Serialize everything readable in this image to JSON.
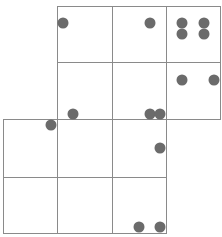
{
  "diagram": {
    "line_color": "#8a8a8a",
    "dot_color": "#6b6b6b",
    "cells": [
      {
        "row": 0,
        "col": 1,
        "x": 57,
        "y": 6,
        "w": 56,
        "h": 57
      },
      {
        "row": 0,
        "col": 2,
        "x": 112,
        "y": 6,
        "w": 55,
        "h": 57
      },
      {
        "row": 0,
        "col": 3,
        "x": 166,
        "y": 6,
        "w": 55,
        "h": 57
      },
      {
        "row": 1,
        "col": 1,
        "x": 57,
        "y": 62,
        "w": 56,
        "h": 58
      },
      {
        "row": 1,
        "col": 2,
        "x": 112,
        "y": 62,
        "w": 55,
        "h": 58
      },
      {
        "row": 1,
        "col": 3,
        "x": 166,
        "y": 62,
        "w": 55,
        "h": 58
      },
      {
        "row": 2,
        "col": 0,
        "x": 3,
        "y": 119,
        "w": 55,
        "h": 59
      },
      {
        "row": 2,
        "col": 1,
        "x": 57,
        "y": 119,
        "w": 56,
        "h": 59
      },
      {
        "row": 2,
        "col": 2,
        "x": 112,
        "y": 119,
        "w": 55,
        "h": 59
      },
      {
        "row": 3,
        "col": 0,
        "x": 3,
        "y": 177,
        "w": 55,
        "h": 57
      },
      {
        "row": 3,
        "col": 1,
        "x": 57,
        "y": 177,
        "w": 56,
        "h": 57
      },
      {
        "row": 3,
        "col": 2,
        "x": 112,
        "y": 177,
        "w": 55,
        "h": 57
      }
    ],
    "dots": [
      {
        "x": 63,
        "y": 23
      },
      {
        "x": 150,
        "y": 23
      },
      {
        "x": 182,
        "y": 23
      },
      {
        "x": 204,
        "y": 23
      },
      {
        "x": 182,
        "y": 34
      },
      {
        "x": 204,
        "y": 34
      },
      {
        "x": 182,
        "y": 80
      },
      {
        "x": 214,
        "y": 80
      },
      {
        "x": 73,
        "y": 114
      },
      {
        "x": 150,
        "y": 114
      },
      {
        "x": 160,
        "y": 114
      },
      {
        "x": 51,
        "y": 125
      },
      {
        "x": 160,
        "y": 148
      },
      {
        "x": 139,
        "y": 227
      },
      {
        "x": 160,
        "y": 227
      }
    ]
  }
}
